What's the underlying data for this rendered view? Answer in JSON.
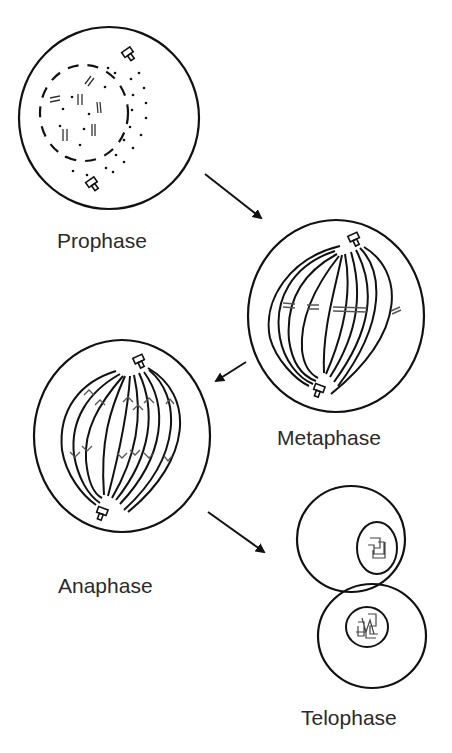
{
  "diagram": {
    "type": "mitosis-stages-cycle",
    "stages": [
      {
        "id": "prophase",
        "label": "Prophase"
      },
      {
        "id": "metaphase",
        "label": "Metaphase"
      },
      {
        "id": "anaphase",
        "label": "Anaphase"
      },
      {
        "id": "telophase",
        "label": "Telophase"
      }
    ],
    "arrows": [
      {
        "from": "prophase",
        "to": "metaphase"
      },
      {
        "from": "metaphase",
        "to": "anaphase"
      },
      {
        "from": "anaphase",
        "to": "telophase"
      }
    ],
    "colors": {
      "stroke": "#111111",
      "text": "#2a2a2a",
      "chromosome": "#555555",
      "background": "#ffffff"
    }
  }
}
